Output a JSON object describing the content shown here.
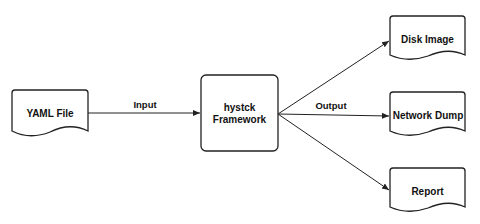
{
  "diagram": {
    "nodes": {
      "yaml": {
        "label": "YAML File"
      },
      "framework": {
        "label_line1": "hystck",
        "label_line2": "Framework"
      },
      "disk": {
        "label": "Disk Image"
      },
      "network": {
        "label": "Network Dump"
      },
      "report": {
        "label": "Report"
      }
    },
    "edges": {
      "input": {
        "label": "Input"
      },
      "output": {
        "label": "Output"
      }
    },
    "colors": {
      "stroke": "#222222",
      "background": "#ffffff"
    }
  }
}
